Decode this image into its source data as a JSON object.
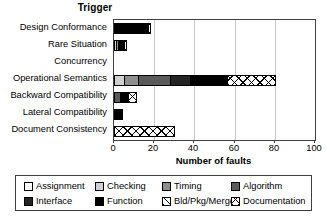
{
  "chart_data": {
    "type": "bar",
    "orientation": "horizontal",
    "stacked": true,
    "title": "Trigger",
    "xlabel": "Number of faults",
    "ylabel": "",
    "xlim": [
      0,
      100
    ],
    "xticks": [
      0,
      20,
      40,
      60,
      80,
      100
    ],
    "grid": true,
    "legend_position": "bottom",
    "categories": [
      "Design Conformance",
      "Rare Situation",
      "Concurrency",
      "Operational Semantics",
      "Backward Compatibility",
      "Lateral Compatibility",
      "Document Consistency"
    ],
    "series": [
      {
        "name": "Assignment",
        "color": "#ffffff",
        "pattern": "solid",
        "values": [
          0,
          0,
          0,
          0,
          0,
          0,
          0
        ]
      },
      {
        "name": "Checking",
        "color": "#d0d0d0",
        "pattern": "solid",
        "values": [
          0,
          1,
          0,
          5,
          0,
          0,
          0
        ]
      },
      {
        "name": "Timing",
        "color": "#8e8e8e",
        "pattern": "solid",
        "values": [
          0,
          1,
          0,
          7,
          0,
          0,
          0
        ]
      },
      {
        "name": "Algorithm",
        "color": "#5a5a5a",
        "pattern": "solid",
        "values": [
          0,
          0,
          0,
          16,
          3,
          0,
          0
        ]
      },
      {
        "name": "Interface",
        "color": "#242424",
        "pattern": "solid",
        "values": [
          0,
          0,
          0,
          10,
          0,
          0,
          0
        ]
      },
      {
        "name": "Function",
        "color": "#000000",
        "pattern": "solid",
        "values": [
          17,
          3,
          0,
          18,
          4,
          4,
          0
        ]
      },
      {
        "name": "Bld/Pkg/Merge",
        "color": "#ffffff",
        "pattern": "diagonal",
        "values": [
          0,
          0,
          0,
          0,
          0,
          0,
          0
        ]
      },
      {
        "name": "Documentation",
        "color": "#ffffff",
        "pattern": "crosshatch",
        "values": [
          1,
          1,
          0,
          24,
          4,
          0,
          30
        ]
      }
    ],
    "totals": [
      18,
      5,
      0,
      80,
      11,
      4,
      30
    ]
  },
  "axis": {
    "tick_labels": [
      "0",
      "20",
      "40",
      "60",
      "80",
      "100"
    ],
    "title": "Number of faults"
  },
  "legend": {
    "items": [
      {
        "label": "Assignment",
        "swatch": "assignment-swatch"
      },
      {
        "label": "Checking",
        "swatch": "checking-swatch"
      },
      {
        "label": "Timing",
        "swatch": "timing-swatch"
      },
      {
        "label": "Algorithm",
        "swatch": "algorithm-swatch"
      },
      {
        "label": "Interface",
        "swatch": "interface-swatch"
      },
      {
        "label": "Function",
        "swatch": "function-swatch"
      },
      {
        "label": "Bld/Pkg/Merge",
        "swatch": "bldpkgmerge-swatch"
      },
      {
        "label": "Documentation",
        "swatch": "documentation-swatch"
      }
    ]
  }
}
